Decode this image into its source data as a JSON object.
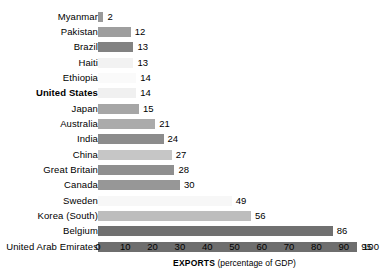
{
  "chart_data": {
    "type": "bar",
    "orientation": "horizontal",
    "title": "",
    "xlabel_bold": "EXPORTS",
    "xlabel_rest": " (percentage of GDP)",
    "ylabel": "",
    "xlim": [
      0,
      100
    ],
    "grid": false,
    "legend": "none",
    "tick_labels": [
      "0",
      "10",
      "20",
      "30",
      "40",
      "50",
      "60",
      "70",
      "80",
      "90",
      "100"
    ],
    "ticks": [
      0,
      10,
      20,
      30,
      40,
      50,
      60,
      70,
      80,
      90,
      100
    ],
    "categories": [
      "Myanmar",
      "Pakistan",
      "Brazil",
      "Haiti",
      "Ethiopia",
      "United States",
      "Japan",
      "Australia",
      "India",
      "China",
      "Great Britain",
      "Canada",
      "Sweden",
      "Korea (South)",
      "Belgium",
      "United Arab Emirates"
    ],
    "values": [
      2,
      12,
      13,
      13,
      14,
      14,
      15,
      21,
      24,
      27,
      28,
      30,
      49,
      56,
      86,
      95
    ],
    "value_labels": [
      "2",
      "12",
      "13",
      "13",
      "14",
      "14",
      "15",
      "21",
      "24",
      "27",
      "28",
      "30",
      "49",
      "56",
      "86",
      "95"
    ],
    "bar_colors": [
      "#9a9a9a",
      "#9e9e9e",
      "#828282",
      "#f2f2f2",
      "#fafafa",
      "#f0f0f0",
      "#a6a6a6",
      "#ababab",
      "#8c8c8c",
      "#c6c6c6",
      "#8f8f8f",
      "#979797",
      "#f7f7f7",
      "#bdbdbd",
      "#707070",
      "#6e6e6e"
    ],
    "highlighted_category": "United States"
  }
}
